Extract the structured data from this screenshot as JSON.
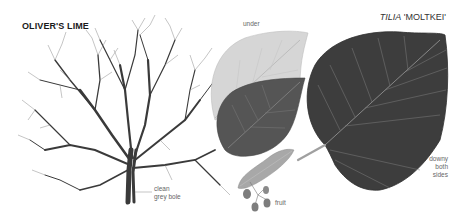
{
  "title": "OLIVER'S LIME",
  "species": {
    "genus": "TILIA",
    "cultivar": "'MOLTKEI'"
  },
  "labels": {
    "under": "under",
    "bole_line1": "clean",
    "bole_line2": "grey bole",
    "fruit": "fruit",
    "downy_line1": "downy",
    "downy_line2": "both",
    "downy_line3": "sides"
  },
  "illustration": {
    "elements": [
      "bare-winter-tree",
      "leaf-underside",
      "leaf-upperside-medium",
      "leaf-upperside-large",
      "fruit-cluster-with-bract"
    ],
    "colors": {
      "background": "#ffffff",
      "branch": "#3a3a3a",
      "leaf_under": "#d6d6d6",
      "leaf_mid": "#555555",
      "leaf_large": "#3d3d3d",
      "vein": "#9a9a9a",
      "bract": "#a8a8a8",
      "fruit": "#7d7d7d"
    }
  }
}
